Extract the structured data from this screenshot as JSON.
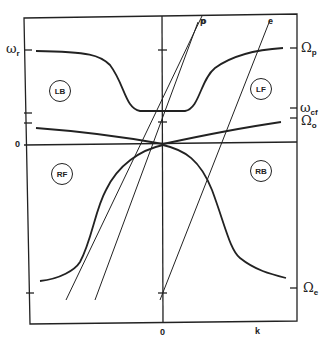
{
  "diagram": {
    "type": "dispersion-relation",
    "axes": {
      "x_label": "k",
      "x_origin_label": "0",
      "y_origin_label": "0"
    },
    "left_ticks": [
      {
        "label": "ωr",
        "main": "ω",
        "sub": "r"
      }
    ],
    "right_ticks": [
      {
        "main": "Ω",
        "sub": "p"
      },
      {
        "main": "ω",
        "sub": "cf"
      },
      {
        "main": "Ω",
        "sub": "o"
      },
      {
        "main": "Ω",
        "sub": "e"
      }
    ],
    "lines": [
      "p",
      "o",
      "e"
    ],
    "regions": [
      "LB",
      "LF",
      "RF",
      "RB"
    ]
  }
}
